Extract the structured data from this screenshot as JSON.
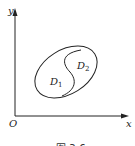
{
  "figure": {
    "axes": {
      "x_label": "x",
      "y_label": "y",
      "origin_label": "O"
    },
    "regions": [
      {
        "label": "D",
        "subscript": "1"
      },
      {
        "label": "D",
        "subscript": "2"
      }
    ],
    "caption": "图 3-6"
  }
}
